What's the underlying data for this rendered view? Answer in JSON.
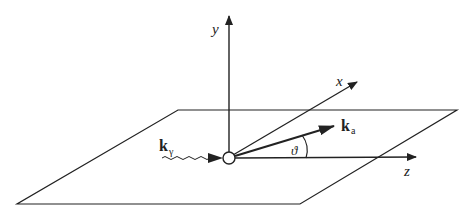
{
  "diagram": {
    "axes": {
      "y_label": "y",
      "x_label": "x",
      "z_label": "z"
    },
    "vectors": {
      "incident": {
        "symbol": "k",
        "subscript": "γ",
        "style": "wavy"
      },
      "outgoing": {
        "symbol": "k",
        "subscript": "a",
        "style": "bold-arrow"
      }
    },
    "angle_label": "ϑ",
    "colors": {
      "ink": "#222222",
      "background": "#ffffff"
    }
  }
}
